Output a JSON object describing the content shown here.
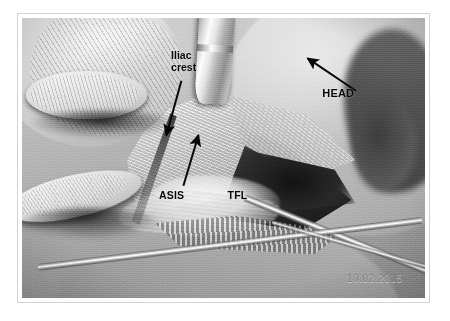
{
  "figure": {
    "type": "intraoperative-photograph",
    "modality": "grayscale clinical photo",
    "frame_border_color": "#d2d2d2",
    "mount_color": "#ffffff",
    "page_background": "#ffffff"
  },
  "annotations": {
    "iliac_crest": {
      "label": "Iliac\ncrest",
      "label_line_1": "Iliac",
      "label_line_2": "crest",
      "marker": "arrow",
      "arrow_direction": "down",
      "color": "#0c0c0c"
    },
    "head": {
      "label": "HEAD",
      "marker": "arrow",
      "arrow_direction": "up-left",
      "color": "#0c0c0c"
    },
    "asis": {
      "label": "ASIS",
      "marker": "arrow",
      "arrow_direction": "up",
      "color": "#0c0c0c"
    },
    "tfl": {
      "label": "TFL",
      "marker": "none",
      "color": "#0c0c0c"
    }
  },
  "timestamp": {
    "date_stamp": "10.02.2015",
    "color": "#7a7a7a"
  },
  "scene": {
    "elements": [
      "gloved-hand-upper-left",
      "gloved-finger-lower-left",
      "metal-retractor-top-center",
      "surgical-wound-center",
      "fascia-flaps",
      "metal-instruments-lower-right",
      "thigh-right"
    ]
  }
}
